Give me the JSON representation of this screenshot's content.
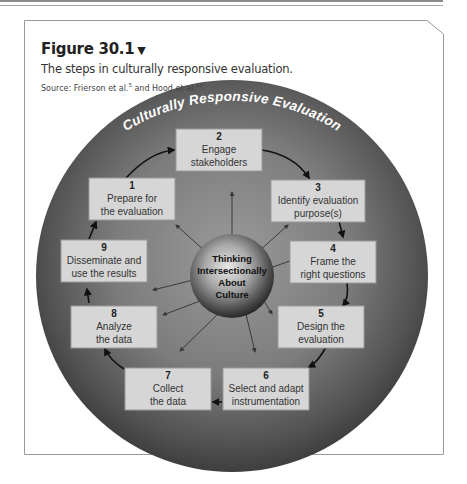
{
  "figure": {
    "label": "Figure 30.1",
    "toggle_glyph": "▼",
    "caption": "The steps in culturally responsive evaluation.",
    "source_prefix": "Source: Frierson et al.",
    "source_ref1": "5",
    "source_mid": " and Hood et al.",
    "source_ref2": "11"
  },
  "diagram": {
    "ring_title": "Culturally Responsive Evaluation",
    "center": {
      "line1": "Thinking",
      "line2": "Intersectionally",
      "line3": "About",
      "line4": "Culture"
    },
    "steps": [
      {
        "number": "1",
        "line1": "Prepare for",
        "line2": "the evaluation"
      },
      {
        "number": "2",
        "line1": "Engage",
        "line2": "stakeholders"
      },
      {
        "number": "3",
        "line1": "Identify evaluation",
        "line2": "purpose(s)"
      },
      {
        "number": "4",
        "line1": "Frame the",
        "line2": "right questions"
      },
      {
        "number": "5",
        "line1": "Design the",
        "line2": "evaluation"
      },
      {
        "number": "6",
        "line1": "Select and adapt",
        "line2": "instrumentation"
      },
      {
        "number": "7",
        "line1": "Collect",
        "line2": "the data"
      },
      {
        "number": "8",
        "line1": "Analyze",
        "line2": "the data"
      },
      {
        "number": "9",
        "line1": "Disseminate and",
        "line2": "use the results"
      }
    ],
    "colors": {
      "ring_outer": "#4a4a4a",
      "ring_inner": "#8c8c8c",
      "box_fill": "#d6d6d6",
      "box_stroke": "#9a9a9a",
      "text": "#333333",
      "arrow": "#111111"
    }
  }
}
